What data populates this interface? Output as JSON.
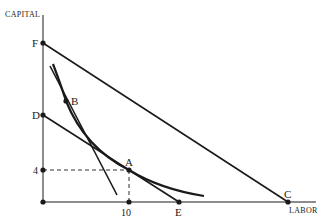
{
  "diagram": {
    "type": "isoquant-isocost",
    "axes": {
      "y_label": "CAPITAL",
      "x_label": "LABOR"
    },
    "ticks": {
      "y_value": "4",
      "x_value": "10"
    },
    "points": {
      "F": "F",
      "D": "D",
      "B": "B",
      "A": "A",
      "E": "E",
      "C": "C"
    },
    "lines": [
      {
        "name": "isocost-FC",
        "from": "F",
        "to": "C"
      },
      {
        "name": "isocost-DE",
        "from": "D",
        "to": "E"
      },
      {
        "name": "tangent-at-B",
        "through": "B"
      }
    ],
    "curves": [
      {
        "name": "isoquant",
        "through": [
          "B",
          "A"
        ]
      }
    ],
    "guides": [
      {
        "name": "dashed-horizontal",
        "from": "4",
        "to": "A"
      },
      {
        "name": "dashed-vertical",
        "from": "A",
        "to": "10"
      }
    ],
    "colors": {
      "ink": "#1a1a1a",
      "background": "#ffffff"
    }
  }
}
